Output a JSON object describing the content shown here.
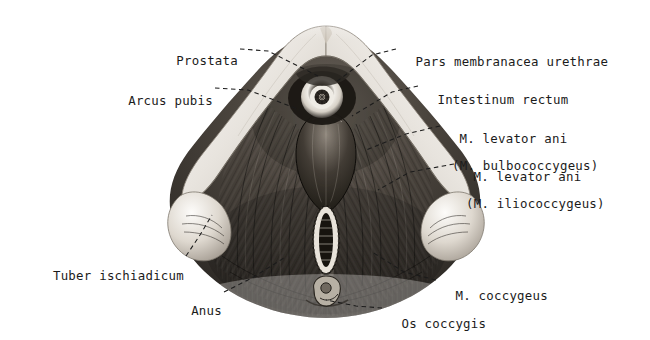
{
  "figure": {
    "kind": "anatomical-illustration",
    "style": "monochrome engraving / halftone plate",
    "background_color": "#ffffff",
    "ink_color": "#1b1b1b",
    "bone_color": "#ece9e4",
    "muscle_dark": "#2a2724"
  },
  "labels": [
    {
      "id": "prostata",
      "text": "Prostata",
      "lines": [
        "Prostata"
      ],
      "side": "left",
      "x": 160,
      "y": 40,
      "leader": "dashed",
      "leader_path": "M 240 49 L 268 51 L 318 76"
    },
    {
      "id": "arcus-pubis",
      "text": "Arcus pubis",
      "lines": [
        "Arcus pubis"
      ],
      "side": "left",
      "x": 104,
      "y": 80,
      "leader": "dashed",
      "leader_path": "M 215 88 L 248 90 L 300 110"
    },
    {
      "id": "pars-membranacea-urethrae",
      "text": "Pars membranacea urethrae",
      "lines": [
        "Pars membranacea urethrae"
      ],
      "side": "right",
      "x": 400,
      "y": 41,
      "leader": "dashed",
      "leader_path": "M 396 49 L 372 55 L 336 82"
    },
    {
      "id": "intestinum-rectum",
      "text": "Intestinum rectum",
      "lines": [
        "Intestinum rectum"
      ],
      "side": "right",
      "x": 422,
      "y": 79,
      "leader": "dashed",
      "leader_path": "M 418 86 L 392 92 L 352 116"
    },
    {
      "id": "m-levator-ani-bulbococcygeus",
      "text": "M. levator ani (M. bulbococcygeus)",
      "lines": [
        "M. levator ani",
        "(M. bulbococcygeus)"
      ],
      "side": "right",
      "x": 444,
      "y": 118,
      "leader": "dashed",
      "leader_path": "M 440 126 L 406 134 L 366 150"
    },
    {
      "id": "m-levator-ani-iliococcygeus",
      "text": "M. levator ani (M. iliococcygeus)",
      "lines": [
        "M. levator ani",
        "(M. iliococcygeus)"
      ],
      "side": "right",
      "x": 458,
      "y": 156,
      "leader": "dashed",
      "leader_path": "M 454 164 L 410 172 L 378 190"
    },
    {
      "id": "tuber-ischiadicum",
      "text": "Tuber ischiadicum",
      "lines": [
        "Tuber ischiadicum"
      ],
      "side": "left",
      "x": 30,
      "y": 255,
      "leader": "dashed",
      "leader_path": "M 186 256 L 200 235 L 212 215"
    },
    {
      "id": "anus",
      "text": "Anus",
      "lines": [
        "Anus"
      ],
      "side": "left",
      "x": 175,
      "y": 290,
      "leader": "dashed",
      "leader_path": "M 224 292 L 252 278 L 284 258"
    },
    {
      "id": "m-coccygeus",
      "text": "M. coccygeus",
      "lines": [
        "M. coccygeus"
      ],
      "side": "right",
      "x": 440,
      "y": 275,
      "leader": "dashed",
      "leader_path": "M 436 280 L 404 272 L 372 252"
    },
    {
      "id": "os-coccygis",
      "text": "Os coccygis",
      "lines": [
        "Os coccygis"
      ],
      "side": "right",
      "x": 386,
      "y": 303,
      "leader": "dashed",
      "leader_path": "M 382 308 L 356 306 L 326 300"
    }
  ]
}
